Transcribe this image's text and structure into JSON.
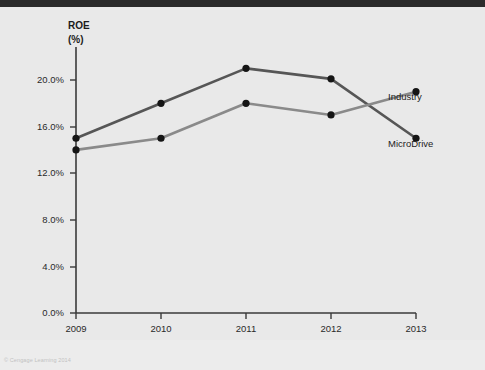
{
  "figure": {
    "copyright": "© Cengage Learning 2014"
  },
  "chart_data": {
    "type": "line",
    "title": "ROE",
    "subtitle": "(%)",
    "xlabel": "",
    "ylabel": "ROE (%)",
    "categories": [
      "2009",
      "2010",
      "2011",
      "2012",
      "2013"
    ],
    "x": [
      2009,
      2010,
      2011,
      2012,
      2013
    ],
    "series": [
      {
        "name": "MicroDrive",
        "values": [
          15.0,
          18.0,
          21.0,
          20.1,
          15.0
        ],
        "color": "#565656",
        "label": "MicroDrive"
      },
      {
        "name": "Industry",
        "values": [
          14.0,
          15.0,
          18.0,
          17.0,
          19.0
        ],
        "color": "#8a8a8a",
        "label": "Industry"
      }
    ],
    "ylim": [
      0,
      22.5
    ],
    "yticks": [
      0,
      4,
      8,
      12,
      16,
      20
    ],
    "ytick_labels": [
      "0.0%",
      "4.0%",
      "8.0%",
      "12.0%",
      "16.0%",
      "20.0%"
    ],
    "xtick_labels": [
      "2009",
      "2010",
      "2011",
      "2012",
      "2013"
    ],
    "grid": false,
    "legend_position": "right-inline",
    "axis_color": "#3a3a3a",
    "background_color": "#e9e9e9"
  }
}
